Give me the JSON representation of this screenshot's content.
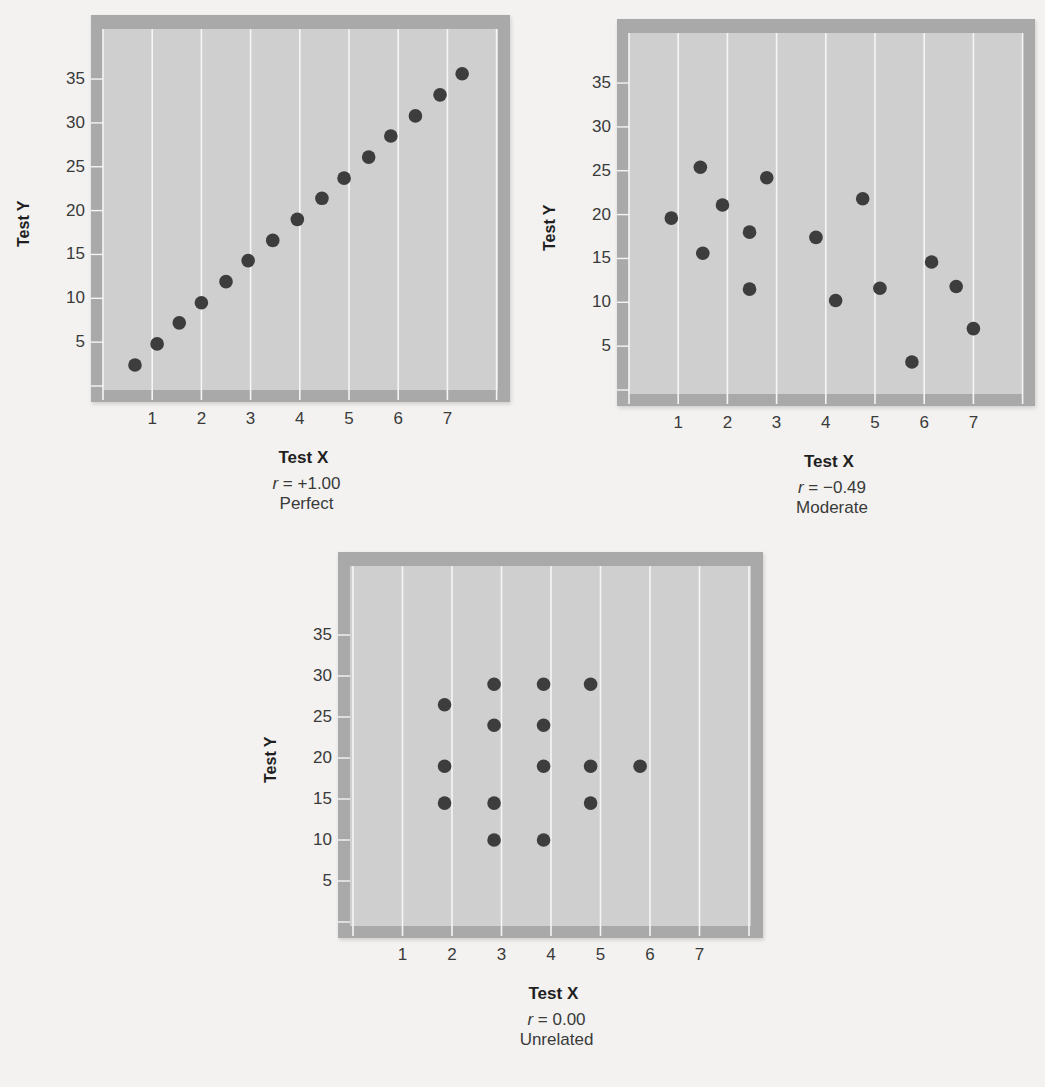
{
  "chart_data": [
    {
      "type": "scatter",
      "title": "",
      "xlabel": "Test X",
      "ylabel": "Test Y",
      "x_ticks": [
        1,
        2,
        3,
        4,
        5,
        6,
        7
      ],
      "y_ticks": [
        5,
        10,
        15,
        20,
        25,
        30,
        35
      ],
      "xlim": [
        0,
        8
      ],
      "ylim": [
        0,
        40
      ],
      "grid": "vertical",
      "r_label": "r",
      "r_value": "= +1.00",
      "description": "Perfect",
      "points": [
        {
          "x": 0.65,
          "y": 2.4
        },
        {
          "x": 1.1,
          "y": 4.8
        },
        {
          "x": 1.55,
          "y": 7.2
        },
        {
          "x": 2.0,
          "y": 9.5
        },
        {
          "x": 2.5,
          "y": 11.9
        },
        {
          "x": 2.95,
          "y": 14.3
        },
        {
          "x": 3.45,
          "y": 16.6
        },
        {
          "x": 3.95,
          "y": 19.0
        },
        {
          "x": 4.45,
          "y": 21.4
        },
        {
          "x": 4.9,
          "y": 23.7
        },
        {
          "x": 5.4,
          "y": 26.1
        },
        {
          "x": 5.85,
          "y": 28.5
        },
        {
          "x": 6.35,
          "y": 30.8
        },
        {
          "x": 6.85,
          "y": 33.2
        },
        {
          "x": 7.3,
          "y": 35.6
        }
      ]
    },
    {
      "type": "scatter",
      "title": "",
      "xlabel": "Test X",
      "ylabel": "Test Y",
      "x_ticks": [
        1,
        2,
        3,
        4,
        5,
        6,
        7
      ],
      "y_ticks": [
        5,
        10,
        15,
        20,
        25,
        30,
        35
      ],
      "xlim": [
        0,
        8
      ],
      "ylim": [
        0,
        40
      ],
      "grid": "vertical",
      "r_label": "r",
      "r_value": "= −0.49",
      "description": "Moderate",
      "points": [
        {
          "x": 0.86,
          "y": 19.6
        },
        {
          "x": 1.45,
          "y": 25.4
        },
        {
          "x": 1.5,
          "y": 15.6
        },
        {
          "x": 1.9,
          "y": 21.1
        },
        {
          "x": 2.45,
          "y": 18.0
        },
        {
          "x": 2.45,
          "y": 11.5
        },
        {
          "x": 2.8,
          "y": 24.2
        },
        {
          "x": 3.8,
          "y": 17.4
        },
        {
          "x": 4.2,
          "y": 10.2
        },
        {
          "x": 4.75,
          "y": 21.8
        },
        {
          "x": 5.1,
          "y": 11.6
        },
        {
          "x": 5.75,
          "y": 3.2
        },
        {
          "x": 6.15,
          "y": 14.6
        },
        {
          "x": 6.65,
          "y": 11.8
        },
        {
          "x": 7.0,
          "y": 7.0
        }
      ]
    },
    {
      "type": "scatter",
      "title": "",
      "xlabel": "Test X",
      "ylabel": "Test Y",
      "x_ticks": [
        1,
        2,
        3,
        4,
        5,
        6,
        7
      ],
      "y_ticks": [
        5,
        10,
        15,
        20,
        25,
        30,
        35
      ],
      "xlim": [
        0,
        8
      ],
      "ylim": [
        0,
        40
      ],
      "grid": "vertical",
      "r_label": "r",
      "r_value": "= 0.00",
      "description": "Unrelated",
      "points": [
        {
          "x": 1.85,
          "y": 26.5
        },
        {
          "x": 1.85,
          "y": 19.0
        },
        {
          "x": 1.85,
          "y": 14.5
        },
        {
          "x": 2.85,
          "y": 29.0
        },
        {
          "x": 2.85,
          "y": 24.0
        },
        {
          "x": 2.85,
          "y": 14.5
        },
        {
          "x": 2.85,
          "y": 10.0
        },
        {
          "x": 3.85,
          "y": 29.0
        },
        {
          "x": 3.85,
          "y": 24.0
        },
        {
          "x": 3.85,
          "y": 19.0
        },
        {
          "x": 3.85,
          "y": 10.0
        },
        {
          "x": 4.8,
          "y": 29.0
        },
        {
          "x": 4.8,
          "y": 19.0
        },
        {
          "x": 4.8,
          "y": 14.5
        },
        {
          "x": 5.8,
          "y": 19.0
        }
      ]
    }
  ],
  "layout_colors": {
    "point": "#3d3d3d",
    "plot_bg": "#cfcfcf",
    "frame": "#a9a9a9",
    "gridline": "#f5f5f5"
  }
}
